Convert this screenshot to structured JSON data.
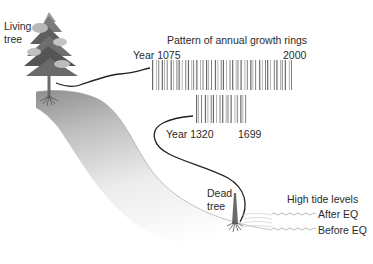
{
  "diagram": {
    "labels": {
      "living_tree": [
        "Living",
        "tree"
      ],
      "rings_title": "Pattern of annual growth rings",
      "living_start_year": "Year 1075",
      "living_end_year": "2000",
      "dead_start_year": "Year 1320",
      "dead_end_year": "1699",
      "dead_tree": [
        "Dead",
        "tree"
      ],
      "high_tide_title": "High tide levels",
      "after_eq": "After EQ",
      "before_eq": "Before EQ"
    },
    "colors": {
      "ground_dark": "#8a8a8a",
      "ground_light": "#ffffff",
      "tree_crown_dark": "#555555",
      "tree_crown_light": "#b5b5b5",
      "trunk": "#6e6e6e",
      "connector_line": "#222222",
      "barcode": "#6a6a6a"
    }
  }
}
